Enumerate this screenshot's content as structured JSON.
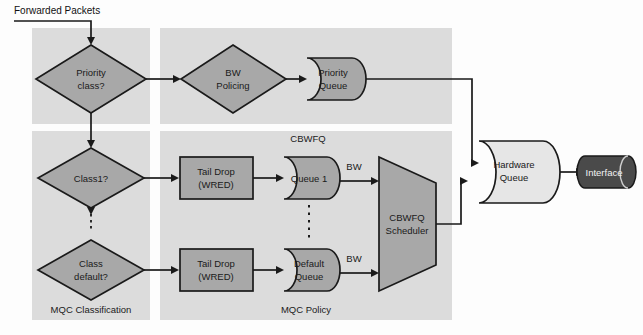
{
  "figure": {
    "title_text": "Forwarded Packets",
    "frame_color": "#fdfdfd",
    "panel_fill": "#dcdcdc",
    "shape_fill": "#a8a8a8",
    "queue_fill": "#e6e6e6",
    "interface_fill": "#4a4a4a",
    "stroke_color": "#1a1a1a"
  },
  "panels": [
    {
      "id": "mqc-classification",
      "label": "MQC Classification"
    },
    {
      "id": "mqc-policy",
      "label": "MQC Policy"
    },
    {
      "id": "priority-top-left",
      "label": ""
    },
    {
      "id": "priority-top-right",
      "label": ""
    }
  ],
  "nodes": {
    "priority_class": {
      "label_line1": "Priority",
      "label_line2": "class?"
    },
    "bw_policing": {
      "label_line1": "BW",
      "label_line2": "Policing"
    },
    "priority_queue": {
      "label_line1": "Priority",
      "label_line2": "Queue"
    },
    "class1": {
      "label_line1": "Class1?",
      "label_line2": ""
    },
    "class_default": {
      "label_line1": "Class",
      "label_line2": "default?"
    },
    "tail_drop_1": {
      "label_line1": "Tail Drop",
      "label_line2": "(WRED)"
    },
    "tail_drop_2": {
      "label_line1": "Tail Drop",
      "label_line2": "(WRED)"
    },
    "queue_1": {
      "label_line1": "Queue 1",
      "label_line2": ""
    },
    "default_queue": {
      "label_line1": "Default",
      "label_line2": "Queue"
    },
    "cbwfq_scheduler": {
      "label_line1": "CBWFQ",
      "label_line2": "Scheduler"
    },
    "hardware_queue": {
      "label_line1": "Hardware",
      "label_line2": "Queue"
    },
    "interface": {
      "label_line1": "Interface",
      "label_line2": ""
    }
  },
  "annotations": {
    "cbwfq": "CBWFQ",
    "bw_top": "BW",
    "bw_bottom": "BW"
  }
}
